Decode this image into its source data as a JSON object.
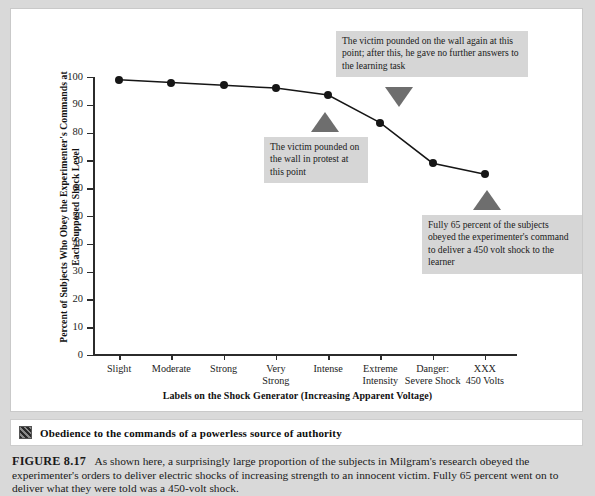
{
  "figure": {
    "banner": {
      "icon": "pixel-thumbnail-icon",
      "title": "Obedience to the commands of a powerless source of authority"
    },
    "caption": {
      "label": "FIGURE 8.17",
      "text": "As shown here, a surprisingly large proportion of the subjects in Milgram's research obeyed the experimenter's orders to deliver electric shocks of increasing strength to an innocent victim. Fully 65 percent went on to deliver what they were told was a 450-volt shock."
    }
  },
  "chart_data": {
    "type": "line",
    "title": "",
    "xlabel": "Labels on the Shock Generator (Increasing Apparent Voltage)",
    "ylabel": "Percent of Subjects Who Obey the Experimenter's Commands at Each Supposed Shock Level",
    "categories": [
      "Slight",
      "Moderate",
      "Strong",
      "Very Strong",
      "Intense",
      "Extreme Intensity",
      "Danger: Severe Shock",
      "XXX 450 Volts"
    ],
    "category_lines": [
      [
        "Slight",
        ""
      ],
      [
        "Moderate",
        ""
      ],
      [
        "Strong",
        ""
      ],
      [
        "Very",
        "Strong"
      ],
      [
        "Intense",
        ""
      ],
      [
        "Extreme",
        "Intensity"
      ],
      [
        "Danger:",
        "Severe Shock"
      ],
      [
        "XXX",
        "450 Volts"
      ]
    ],
    "values": [
      99,
      98,
      97,
      96,
      93.5,
      83.5,
      69,
      65
    ],
    "ylim": [
      0,
      100
    ],
    "yticks": [
      0,
      10,
      20,
      30,
      40,
      50,
      60,
      70,
      80,
      90,
      100
    ],
    "ytick_labels": [
      "0",
      "10",
      "20",
      "30",
      "40",
      "50",
      "60",
      "70",
      "80",
      "90",
      "100"
    ],
    "grid": false,
    "legend": "none",
    "marker": "filled-circle",
    "line_color": "#161616",
    "marker_color": "#161616",
    "annotations": [
      {
        "id": "annotation-intense",
        "text": "The victim pounded on the wall in protest at this point",
        "points_to": "Intense",
        "pointer": "up"
      },
      {
        "id": "annotation-extreme-intensity",
        "text": "The victim pounded on the wall again at this point; after this, he gave no further answers to the learning task",
        "points_to": "Extreme Intensity",
        "pointer": "down"
      },
      {
        "id": "annotation-xxx",
        "text": "Fully 65 percent of the subjects obeyed the experimenter's command to deliver a 450 volt shock to the learner",
        "points_to": "XXX 450 Volts",
        "pointer": "up"
      }
    ]
  },
  "colors": {
    "page_background": "#d9d9d9",
    "panel_background": "#ffffff",
    "callout_background": "#d6d6d6",
    "pointer": "#6e6e6e",
    "ink": "#161616"
  }
}
